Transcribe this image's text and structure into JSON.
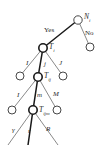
{
  "figure": {
    "type": "tree-diagram",
    "width": 111,
    "height": 145,
    "background_color": "#ffffff",
    "line_color": "#6b6b6b",
    "highlight_line_color": "#1a1a1a",
    "node_stroke_color": "#333333",
    "node_fill_color": "#ffffff",
    "text_color": "#2b2b2b"
  },
  "nodes": {
    "root": {
      "label": "N",
      "subscript": "i",
      "cx": 78,
      "cy": 20,
      "r": 4.2,
      "emphasis": false
    },
    "no_child": {
      "label": "",
      "subscript": "",
      "cx": 90,
      "cy": 47,
      "r": 4.0,
      "emphasis": false
    },
    "level1_center": {
      "label": "T",
      "subscript": "i",
      "cx": 43,
      "cy": 48,
      "r": 4.2,
      "emphasis": true
    },
    "level2_left": {
      "label": "",
      "subscript": "",
      "cx": 20,
      "cy": 76,
      "r": 4.0,
      "emphasis": false
    },
    "level2_center": {
      "label": "T",
      "subscript": "ij",
      "cx": 38,
      "cy": 77,
      "r": 4.2,
      "emphasis": true
    },
    "level2_right": {
      "label": "",
      "subscript": "",
      "cx": 63,
      "cy": 76,
      "r": 4.0,
      "emphasis": false
    },
    "level3_left": {
      "label": "",
      "subscript": "",
      "cx": 12,
      "cy": 110,
      "r": 4.0,
      "emphasis": false
    },
    "level3_center": {
      "label": "T",
      "subscript": "ijm",
      "cx": 33,
      "cy": 110,
      "r": 4.2,
      "emphasis": true
    },
    "level3_right": {
      "label": "",
      "subscript": "",
      "cx": 57,
      "cy": 110,
      "r": 4.0,
      "emphasis": false
    }
  },
  "edges": [
    {
      "name": "root-to-yes",
      "from": "root",
      "to": "level1_center",
      "highlight": true
    },
    {
      "name": "root-to-no",
      "from": "root",
      "to": "no_child",
      "highlight": false
    },
    {
      "name": "ti-to-I",
      "from": "level1_center",
      "to": "level2_left",
      "highlight": false
    },
    {
      "name": "ti-to-j",
      "from": "level1_center",
      "to": "level2_center",
      "highlight": true
    },
    {
      "name": "ti-to-J",
      "from": "level1_center",
      "to": "level2_right",
      "highlight": false
    },
    {
      "name": "tij-to-I",
      "from": "level2_center",
      "to": "level3_left",
      "highlight": false
    },
    {
      "name": "tij-to-m",
      "from": "level2_center",
      "to": "level3_center",
      "highlight": true
    },
    {
      "name": "tij-to-M",
      "from": "level2_center",
      "to": "level3_right",
      "highlight": false
    },
    {
      "name": "tijm-to-gamma",
      "from": "level3_center",
      "to": "leaf_gamma",
      "highlight": false
    },
    {
      "name": "tijm-to-r",
      "from": "level3_center",
      "to": "leaf_r",
      "highlight": true
    },
    {
      "name": "tijm-to-R",
      "from": "level3_center",
      "to": "leaf_R",
      "highlight": false
    }
  ],
  "leaves": {
    "leaf_gamma": {
      "x": 8,
      "y": 145
    },
    "leaf_r": {
      "x": 28,
      "y": 145
    },
    "leaf_R": {
      "x": 58,
      "y": 145
    }
  },
  "edge_labels": [
    {
      "name": "yes-label",
      "text": "Yes",
      "x": 44,
      "y": 27,
      "style": "yesno"
    },
    {
      "name": "no-label",
      "text": "No",
      "x": 85,
      "y": 30,
      "style": "yesno"
    },
    {
      "name": "branch-I-level1",
      "text": "I",
      "x": 26,
      "y": 60,
      "style": "branch"
    },
    {
      "name": "branch-j-level1",
      "text": "j",
      "x": 44,
      "y": 61,
      "style": "branch"
    },
    {
      "name": "branch-J-level1",
      "text": "J",
      "x": 59,
      "y": 60,
      "style": "branch"
    },
    {
      "name": "branch-I-level2",
      "text": "I",
      "x": 17,
      "y": 92,
      "style": "branch"
    },
    {
      "name": "branch-m-level2",
      "text": "m",
      "x": 37,
      "y": 92,
      "style": "branch"
    },
    {
      "name": "branch-M-level2",
      "text": "M",
      "x": 53,
      "y": 91,
      "style": "branch"
    },
    {
      "name": "branch-gamma-level3",
      "text": "γ",
      "x": 12,
      "y": 127,
      "style": "branch"
    },
    {
      "name": "branch-r-level3",
      "text": "r",
      "x": 28,
      "y": 128,
      "style": "branch"
    },
    {
      "name": "branch-R-level3",
      "text": "R",
      "x": 46,
      "y": 126,
      "style": "branch"
    }
  ],
  "node_labels": [
    {
      "name": "node-label-root",
      "base": "N",
      "sub": "i",
      "x": 84,
      "y": 13
    },
    {
      "name": "node-label-ti",
      "base": "T",
      "sub": "i",
      "x": 49,
      "y": 43
    },
    {
      "name": "node-label-tij",
      "base": "T",
      "sub": "ij",
      "x": 44,
      "y": 72
    },
    {
      "name": "node-label-tijm",
      "base": "T",
      "sub": "ijm",
      "x": 39,
      "y": 106
    }
  ]
}
